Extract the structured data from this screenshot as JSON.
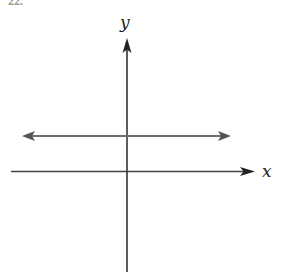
{
  "header": {
    "problem_number_fragment": "22."
  },
  "diagram": {
    "type": "coordinate-plane-graph",
    "x_axis": {
      "label": "x",
      "color": "#333333"
    },
    "y_axis": {
      "label": "y",
      "color": "#333333"
    },
    "graphed_line": {
      "description": "horizontal line above the x-axis with arrows at both ends",
      "color": "#6e6e6e"
    }
  }
}
